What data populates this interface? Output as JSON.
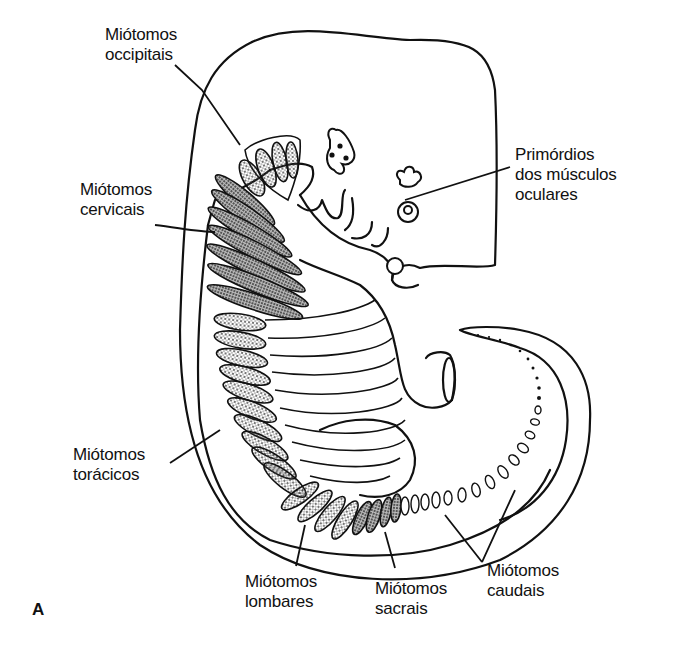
{
  "figure": {
    "panel_label": "A",
    "labels": {
      "occipital": [
        "Miótomos",
        "occipitais"
      ],
      "cervical": [
        "Miótomos",
        "cervicais"
      ],
      "thoracic": [
        "Miótomos",
        "torácicos"
      ],
      "lumbar": [
        "Miótomos",
        "lombares"
      ],
      "sacral": [
        "Miótomos",
        "sacrais"
      ],
      "caudal": [
        "Miótomos",
        "caudais"
      ],
      "ocular": [
        "Primórdios",
        "dos músculos",
        "oculares"
      ]
    },
    "colors": {
      "line": "#111111",
      "background": "#ffffff",
      "stipple": "#555555"
    }
  }
}
